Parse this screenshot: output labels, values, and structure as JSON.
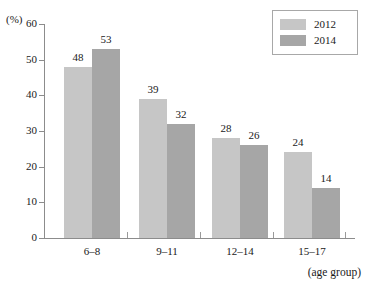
{
  "chart_data": {
    "type": "bar",
    "title": "",
    "xlabel": "(age group)",
    "ylabel": "(%)",
    "categories": [
      "6–8",
      "9–11",
      "12–14",
      "15–17"
    ],
    "series": [
      {
        "name": "2012",
        "color": "#c6c6c6",
        "values": [
          48,
          39,
          28,
          24
        ]
      },
      {
        "name": "2014",
        "color": "#a6a6a6",
        "values": [
          53,
          32,
          26,
          14
        ]
      }
    ],
    "ylim": [
      0,
      60
    ],
    "yticks": [
      0,
      10,
      20,
      30,
      40,
      50,
      60
    ],
    "ytick_labels": [
      "0",
      "10",
      "20",
      "30",
      "40",
      "50",
      "60"
    ],
    "grid": false,
    "legend_position": "top-right",
    "value_labels": true
  },
  "legend": {
    "entries": [
      {
        "label": "2012",
        "color": "#c6c6c6"
      },
      {
        "label": "2014",
        "color": "#a6a6a6"
      }
    ]
  },
  "axes": {
    "y_unit": "(%)",
    "x_title": "(age group)"
  }
}
